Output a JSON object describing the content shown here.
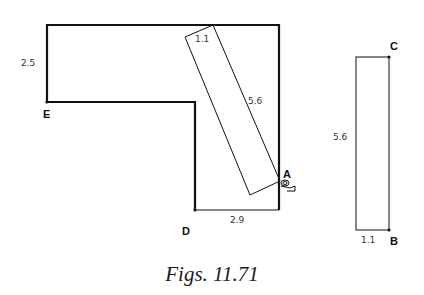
{
  "figure": {
    "caption": "Figs. 11.71",
    "colors": {
      "stroke": "#111111",
      "text": "#333333"
    },
    "l_shape": {
      "labels": {
        "height_top_arm": "2.5",
        "bottom_width": "2.9"
      },
      "points": {
        "E": "E",
        "D": "D"
      }
    },
    "tilted_rectangle": {
      "labels": {
        "short_side": "1.1",
        "long_side": "5.6"
      },
      "pivot_point": "A"
    },
    "upright_rectangle": {
      "labels": {
        "long_side": "5.6",
        "short_side": "1.1"
      },
      "points": {
        "C": "C",
        "B": "B"
      }
    }
  }
}
